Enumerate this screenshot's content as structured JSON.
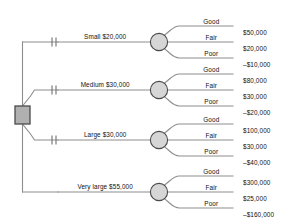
{
  "diagram": {
    "type": "decision-tree",
    "title": "",
    "root": {
      "shape": "square",
      "name": "decision-node",
      "fill": "#b0b0b0"
    },
    "chance_node": {
      "shape": "circle",
      "fill": "#d6d6d6"
    },
    "colors": {
      "line": "#8d8d8d",
      "node_stroke": "#4a4a4a",
      "text": "#111111"
    },
    "outcome_labels": [
      "Good",
      "Fair",
      "Poor"
    ],
    "branches": [
      {
        "label": "Small $20,000",
        "cost": "$20,000",
        "has_cut_marks": true,
        "outcomes": [
          {
            "label": "Good",
            "value": "$50,000"
          },
          {
            "label": "Fair",
            "value": "$20,000"
          },
          {
            "label": "Poor",
            "value": "–$10,000"
          }
        ]
      },
      {
        "label": "Medium $30,000",
        "cost": "$30,000",
        "has_cut_marks": true,
        "outcomes": [
          {
            "label": "Good",
            "value": "$80,000"
          },
          {
            "label": "Fair",
            "value": "$30,000"
          },
          {
            "label": "Poor",
            "value": "–$20,000"
          }
        ]
      },
      {
        "label": "Large $30,000",
        "cost": "$30,000",
        "has_cut_marks": true,
        "outcomes": [
          {
            "label": "Good",
            "value": "$100,000"
          },
          {
            "label": "Fair",
            "value": "$30,000"
          },
          {
            "label": "Poor",
            "value": "–$40,000"
          }
        ]
      },
      {
        "label": "Very large $55,000",
        "cost": "$55,000",
        "has_cut_marks": false,
        "outcomes": [
          {
            "label": "Good",
            "value": "$300,000"
          },
          {
            "label": "Fair",
            "value": "$25,000"
          },
          {
            "label": "Poor",
            "value": "–$160,000"
          }
        ]
      }
    ]
  }
}
